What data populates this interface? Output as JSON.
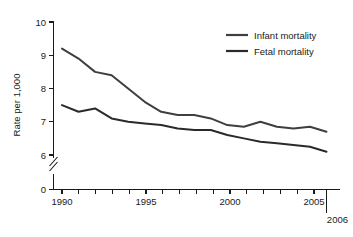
{
  "chart_data": {
    "type": "line",
    "title": "",
    "xlabel": "",
    "ylabel": "Rate per 1,000",
    "xlim": [
      1990,
      2006
    ],
    "ylim": [
      6,
      10
    ],
    "y_axis_break": true,
    "y_axis_break_note": "axis broken between 0 and 6",
    "grid": false,
    "legend_position": "top-right",
    "x": [
      1990,
      1991,
      1992,
      1993,
      1994,
      1995,
      1996,
      1997,
      1998,
      1999,
      2000,
      2001,
      2002,
      2003,
      2004,
      2005,
      2006
    ],
    "series": [
      {
        "name": "Infant mortality",
        "color": "#3f3f3f",
        "values": [
          9.2,
          8.9,
          8.5,
          8.4,
          8.0,
          7.6,
          7.3,
          7.2,
          7.2,
          7.1,
          6.9,
          6.85,
          7.0,
          6.85,
          6.8,
          6.85,
          6.7
        ]
      },
      {
        "name": "Fetal mortality",
        "color": "#2a2a2a",
        "values": [
          7.5,
          7.3,
          7.4,
          7.1,
          7.0,
          6.95,
          6.9,
          6.8,
          6.75,
          6.75,
          6.6,
          6.5,
          6.4,
          6.35,
          6.3,
          6.25,
          6.1
        ]
      }
    ],
    "y_ticks": [
      {
        "value": 10,
        "label": "10"
      },
      {
        "value": 9,
        "label": "9"
      },
      {
        "value": 8,
        "label": "8"
      },
      {
        "value": 7,
        "label": "7"
      },
      {
        "value": 6,
        "label": "6"
      },
      {
        "value": 0,
        "label": "0"
      }
    ],
    "x_ticks": [
      {
        "value": 1990,
        "label": "1990"
      },
      {
        "value": 1991,
        "label": ""
      },
      {
        "value": 1992,
        "label": ""
      },
      {
        "value": 1993,
        "label": ""
      },
      {
        "value": 1994,
        "label": ""
      },
      {
        "value": 1995,
        "label": "1995"
      },
      {
        "value": 1996,
        "label": ""
      },
      {
        "value": 1997,
        "label": ""
      },
      {
        "value": 1998,
        "label": ""
      },
      {
        "value": 1999,
        "label": ""
      },
      {
        "value": 2000,
        "label": "2000"
      },
      {
        "value": 2001,
        "label": ""
      },
      {
        "value": 2002,
        "label": ""
      },
      {
        "value": 2003,
        "label": ""
      },
      {
        "value": 2004,
        "label": ""
      },
      {
        "value": 2005,
        "label": "2005"
      },
      {
        "value": 2006,
        "label": "2006"
      }
    ],
    "x_tick_labels_visible": [
      "1990",
      "1995",
      "2000",
      "2005",
      "2006"
    ],
    "final_year_label": "2006"
  },
  "axis": {
    "y_title": "Rate per 1,000",
    "y_label_10": "10",
    "y_label_9": "9",
    "y_label_8": "8",
    "y_label_7": "7",
    "y_label_6": "6",
    "y_label_0": "0",
    "x_label_1990": "1990",
    "x_label_1995": "1995",
    "x_label_2000": "2000",
    "x_label_2005": "2005",
    "x_label_2006": "2006"
  },
  "legend": {
    "items": [
      {
        "label": "Infant mortality"
      },
      {
        "label": "Fetal mortality"
      }
    ]
  }
}
